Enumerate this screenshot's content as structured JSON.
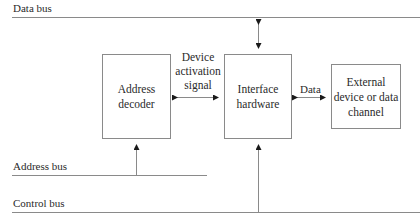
{
  "buses": {
    "data_bus": "Data bus",
    "address_bus": "Address bus",
    "control_bus": "Control bus"
  },
  "blocks": {
    "address_decoder": [
      "Address",
      "decoder"
    ],
    "interface_hardware": [
      "Interface",
      "hardware"
    ],
    "external_device": [
      "External",
      "device or data",
      "channel"
    ]
  },
  "connections": {
    "device_activation_signal": [
      "Device",
      "activation",
      "signal"
    ],
    "data": "Data"
  },
  "colors": {
    "line": "#8a8a8a",
    "text": "#2a2a2a",
    "background": "#ffffff"
  }
}
